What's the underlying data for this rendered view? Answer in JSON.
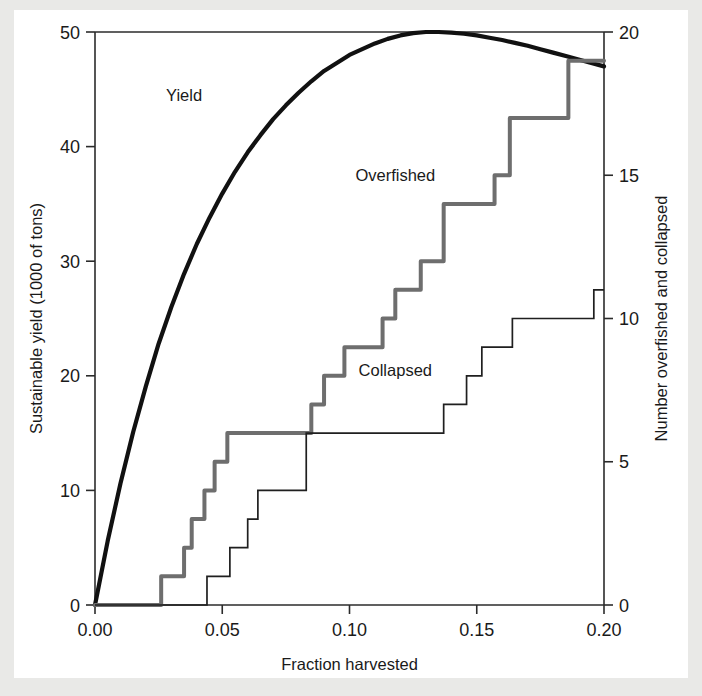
{
  "figure": {
    "background_color": "#e9e9e7",
    "paper_color": "#ffffff"
  },
  "chart_data": {
    "type": "line",
    "title": "",
    "xlabel": "Fraction harvested",
    "ylabel": "Sustainable yield (1000 of tons)",
    "ylabel_right": "Number overfished and collapsed",
    "xlim": [
      0.0,
      0.2
    ],
    "ylim": [
      0,
      50
    ],
    "ylim_right": [
      0,
      20
    ],
    "grid": false,
    "legend": "inline-annotations",
    "xticks": [
      0.0,
      0.05,
      0.1,
      0.15,
      0.2
    ],
    "xticklabels": [
      "0.00",
      "0.05",
      "0.10",
      "0.15",
      "0.20"
    ],
    "yticks": [
      0,
      10,
      20,
      30,
      40,
      50
    ],
    "yticklabels": [
      "0",
      "10",
      "20",
      "30",
      "40",
      "50"
    ],
    "yticks_right": [
      0,
      5,
      10,
      15,
      20
    ],
    "yticklabels_right": [
      "0",
      "5",
      "10",
      "15",
      "20"
    ],
    "series": [
      {
        "name": "Yield",
        "axis": "left",
        "color": "#111111",
        "linewidth": 4.2,
        "style": "smooth-curve",
        "x": [
          0.0,
          0.005,
          0.01,
          0.015,
          0.02,
          0.025,
          0.03,
          0.035,
          0.04,
          0.045,
          0.05,
          0.055,
          0.06,
          0.065,
          0.07,
          0.075,
          0.08,
          0.085,
          0.09,
          0.095,
          0.1,
          0.105,
          0.11,
          0.115,
          0.12,
          0.125,
          0.13,
          0.135,
          0.14,
          0.145,
          0.15,
          0.155,
          0.16,
          0.165,
          0.17,
          0.175,
          0.18,
          0.185,
          0.19,
          0.195,
          0.2
        ],
        "y": [
          0.0,
          5.6,
          10.6,
          15.1,
          19.1,
          22.8,
          26.0,
          28.9,
          31.5,
          33.8,
          35.9,
          37.8,
          39.5,
          41.0,
          42.4,
          43.6,
          44.7,
          45.7,
          46.6,
          47.3,
          48.0,
          48.5,
          49.0,
          49.4,
          49.7,
          49.9,
          50.0,
          50.0,
          49.95,
          49.85,
          49.7,
          49.5,
          49.3,
          49.05,
          48.8,
          48.5,
          48.2,
          47.9,
          47.6,
          47.3,
          47.0
        ]
      },
      {
        "name": "Overfished",
        "axis": "right",
        "color": "#6e6e6e",
        "linewidth": 4.0,
        "style": "step-post",
        "x": [
          0.0,
          0.026,
          0.026,
          0.035,
          0.035,
          0.038,
          0.038,
          0.043,
          0.043,
          0.047,
          0.047,
          0.052,
          0.052,
          0.085,
          0.085,
          0.09,
          0.09,
          0.098,
          0.098,
          0.113,
          0.113,
          0.118,
          0.118,
          0.128,
          0.128,
          0.137,
          0.137,
          0.157,
          0.157,
          0.163,
          0.163,
          0.186,
          0.186,
          0.2
        ],
        "y": [
          0,
          0,
          1,
          1,
          2,
          2,
          3,
          3,
          4,
          4,
          5,
          5,
          6,
          6,
          7,
          7,
          8,
          8,
          9,
          9,
          10,
          10,
          11,
          11,
          12,
          12,
          14,
          14,
          15,
          15,
          17,
          17,
          19,
          19
        ]
      },
      {
        "name": "Collapsed",
        "axis": "right",
        "color": "#1f1f1f",
        "linewidth": 1.7,
        "style": "step-post",
        "x": [
          0.0,
          0.044,
          0.044,
          0.053,
          0.053,
          0.06,
          0.06,
          0.064,
          0.064,
          0.083,
          0.083,
          0.137,
          0.137,
          0.146,
          0.146,
          0.152,
          0.152,
          0.164,
          0.164,
          0.196,
          0.196,
          0.2
        ],
        "y": [
          0,
          0,
          1,
          1,
          2,
          2,
          3,
          3,
          4,
          4,
          6,
          6,
          7,
          7,
          8,
          8,
          9,
          9,
          10,
          10,
          11,
          11
        ]
      }
    ],
    "annotations": [
      {
        "text": "Yield",
        "x": 0.035,
        "y_right": 17.6
      },
      {
        "text": "Overfished",
        "x": 0.118,
        "y_right": 14.8
      },
      {
        "text": "Collapsed",
        "x": 0.118,
        "y_right": 8.0
      }
    ]
  }
}
